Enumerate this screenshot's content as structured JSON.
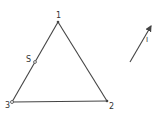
{
  "diagram": {
    "type": "triangle-with-vector",
    "colors": {
      "line": "#444444",
      "text": "#333333",
      "background": "#ffffff"
    },
    "vertices": [
      {
        "id": "1",
        "label": "1",
        "x": 58,
        "y": 22,
        "label_x": 56,
        "label_y": 18
      },
      {
        "id": "2",
        "label": "2",
        "x": 107,
        "y": 101,
        "label_x": 109,
        "label_y": 109
      },
      {
        "id": "3",
        "label": "3",
        "x": 12,
        "y": 102,
        "label_x": 5,
        "label_y": 108
      }
    ],
    "edges": [
      {
        "from": "1",
        "to": "2"
      },
      {
        "from": "2",
        "to": "3"
      },
      {
        "from": "3",
        "to": "1"
      }
    ],
    "points": [
      {
        "id": "S",
        "label": "S",
        "x": 35,
        "y": 62,
        "label_x": 26,
        "label_y": 62,
        "on_edge": "3-1"
      }
    ],
    "vector": {
      "label": "I",
      "from": {
        "x": 130,
        "y": 62
      },
      "to": {
        "x": 152,
        "y": 24
      },
      "label_x": 146,
      "label_y": 42
    }
  }
}
